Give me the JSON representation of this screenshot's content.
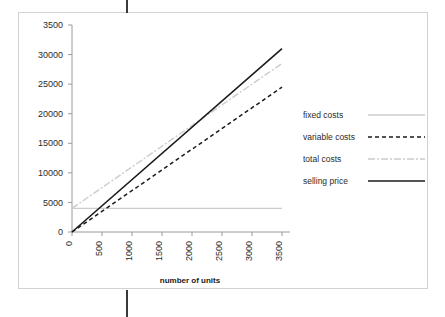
{
  "document": {
    "margin_marker_name": "page-margin-rule"
  },
  "chart_data": {
    "type": "line",
    "title": "",
    "subtitle": "",
    "xlabel": "number of units",
    "ylabel": "",
    "xlim": [
      0,
      3500
    ],
    "ylim": [
      0,
      35000
    ],
    "grid": false,
    "legend_position": "right",
    "x": [
      0,
      3500
    ],
    "xticks": [
      "0",
      "500",
      "1000",
      "1500",
      "2000",
      "2500",
      "3000",
      "3500"
    ],
    "xtick_values": [
      0,
      500,
      1000,
      1500,
      2000,
      2500,
      3000,
      3500
    ],
    "yticks": [
      "0",
      "5000",
      "10000",
      "15000",
      "20000",
      "25000",
      "30000",
      "3500"
    ],
    "ytick_values": [
      0,
      5000,
      10000,
      15000,
      20000,
      25000,
      30000,
      35000
    ],
    "series": [
      {
        "name": "fixed costs",
        "style": "solid",
        "color": "#cccccc",
        "width": 1.4,
        "values": [
          4000,
          4000
        ]
      },
      {
        "name": "variable costs",
        "style": "dashed",
        "color": "#1b1b1b",
        "width": 1.5,
        "values": [
          0,
          24500
        ]
      },
      {
        "name": "total costs",
        "style": "dashdot",
        "color": "#cccccc",
        "width": 1.4,
        "values": [
          4000,
          28500
        ]
      },
      {
        "name": "selling price",
        "style": "solid",
        "color": "#1b1b1b",
        "width": 1.6,
        "values": [
          0,
          31000
        ]
      }
    ]
  },
  "legend": {
    "entries": [
      {
        "label": "fixed costs"
      },
      {
        "label": "variable costs"
      },
      {
        "label": "total costs"
      },
      {
        "label": "selling price"
      }
    ]
  },
  "colors": {
    "frame": "#d2d2d2",
    "axis": "#9a9a9a",
    "ink": "#1b1b1b",
    "light": "#cccccc",
    "margin_rule": "#3a3a3a"
  }
}
